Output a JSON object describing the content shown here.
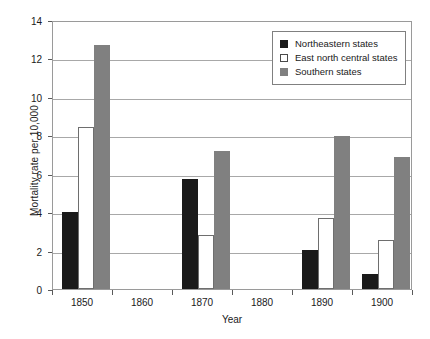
{
  "chart_data": {
    "type": "bar",
    "title": "",
    "xlabel": "Year",
    "ylabel": "Mortality rate per 10,000",
    "categories": [
      "1850",
      "1860",
      "1870",
      "1880",
      "1890",
      "1900"
    ],
    "series": [
      {
        "name": "Northeastern states",
        "color": "#1a1a1a",
        "values": [
          4.0,
          null,
          5.7,
          null,
          2.05,
          0.8
        ]
      },
      {
        "name": "East north central states",
        "color": "#ffffff",
        "values": [
          8.45,
          null,
          2.8,
          null,
          3.7,
          2.55
        ]
      },
      {
        "name": "Southern states",
        "color": "#808080",
        "values": [
          12.7,
          null,
          7.2,
          null,
          7.95,
          6.85
        ]
      }
    ],
    "ylim": [
      0,
      14
    ],
    "yticks": [
      0,
      2,
      4,
      6,
      8,
      10,
      12,
      14
    ],
    "ytick_labels": [
      "0",
      "2",
      "4",
      "6",
      "8",
      "10",
      "12",
      "14"
    ],
    "grid": true,
    "legend_position": "top-right"
  }
}
